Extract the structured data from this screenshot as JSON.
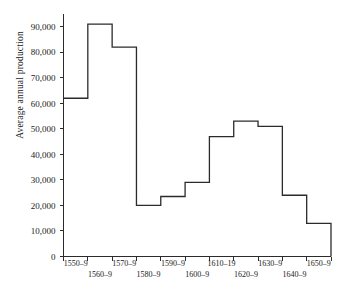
{
  "chart_data": {
    "type": "bar",
    "title": "",
    "subtitle": "",
    "xlabel": "",
    "ylabel": "Average annual production",
    "categories": [
      "1550–9",
      "1560–9",
      "1570–9",
      "1580–9",
      "1590–9",
      "1600–9",
      "1610–19",
      "1620–9",
      "1630–9",
      "1640–9",
      "1650–9"
    ],
    "values": [
      62000,
      91000,
      82000,
      20000,
      23500,
      29000,
      47000,
      53000,
      51000,
      24000,
      13000
    ],
    "ylim": [
      0,
      95000
    ],
    "ytick_values": [
      0,
      10000,
      20000,
      30000,
      40000,
      50000,
      60000,
      70000,
      80000,
      90000
    ],
    "ytick_labels": [
      "0",
      "10,000",
      "20,000",
      "30,000",
      "40,000",
      "50,000",
      "60,000",
      "70,000",
      "80,000",
      "90,000"
    ],
    "grid": false,
    "legend": null,
    "legend_position": "none",
    "style": "step-histogram",
    "line_color": "#2b2b2b",
    "background_color": "#ffffff",
    "xtick_label_rows": 2,
    "xtick_labels_row_top": [
      "1550–9",
      "1570–9",
      "1590–9",
      "1610–19",
      "1630–9",
      "1650–9"
    ],
    "xtick_labels_row_bottom": [
      "1560–9",
      "1580–9",
      "1600–9",
      "1620–9",
      "1640–9"
    ]
  }
}
